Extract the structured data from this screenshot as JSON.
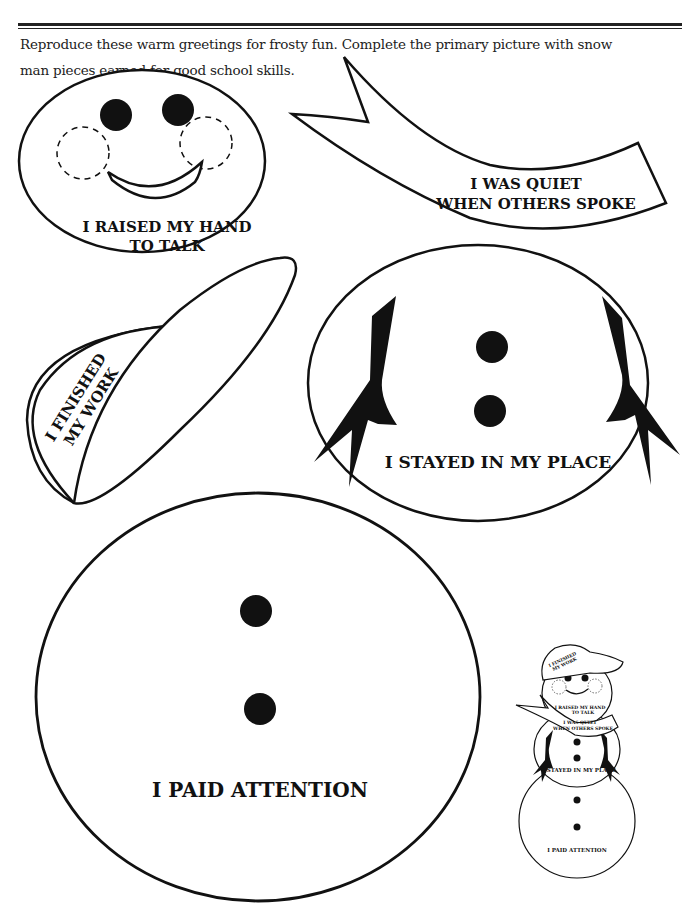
{
  "header": {
    "instructions_line1": "Reproduce these warm greetings for frosty fun. Complete the primary picture with snow",
    "instructions_line2": "man pieces earned for good school skills."
  },
  "pieces": {
    "head": {
      "label_line1": "I RAISED MY HAND",
      "label_line2": "TO TALK"
    },
    "scarf": {
      "label_line1": "I WAS QUIET",
      "label_line2": "WHEN OTHERS SPOKE"
    },
    "hat": {
      "label_line1": "I FINISHED",
      "label_line2": "MY WORK"
    },
    "middle_body": {
      "label": "I STAYED IN MY PLACE"
    },
    "bottom_body": {
      "label": "I PAID ATTENTION"
    }
  },
  "preview_snowman": {
    "hat_line1": "I FINISHED",
    "hat_line2": "MY WORK",
    "head_line1": "I RAISED MY HAND",
    "head_line2": "TO TALK",
    "scarf_line1": "I WAS QUIET",
    "scarf_line2": "WHEN OTHERS SPOKE",
    "middle_label": "I STAYED IN MY PLACE",
    "bottom_label": "I PAID ATTENTION"
  },
  "colors": {
    "ink": "#111111",
    "paper": "#ffffff"
  }
}
